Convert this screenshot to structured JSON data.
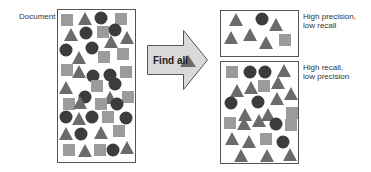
{
  "labels": {
    "document": "Document",
    "arrow": "Find all",
    "precision_box": [
      "High precision,",
      "low recall"
    ],
    "recall_box": [
      "High recall,",
      "low precision"
    ]
  },
  "colors": {
    "square": "#9b9b9b",
    "triangle": "#6b6b6b",
    "circle": "#3c3c3c",
    "arrow_fill": "#d9d9d9",
    "outline": "#555555"
  },
  "boxes": {
    "document": {
      "x": 57,
      "y": 9,
      "w": 78,
      "h": 153
    },
    "precision": {
      "x": 220,
      "y": 10,
      "w": 78,
      "h": 46
    },
    "recall": {
      "x": 220,
      "y": 61,
      "w": 78,
      "h": 102
    }
  },
  "shapes": {
    "document": [
      [
        "s",
        67,
        20
      ],
      [
        "t",
        85,
        19
      ],
      [
        "c",
        101,
        18
      ],
      [
        "s",
        121,
        19
      ],
      [
        "t",
        71,
        35
      ],
      [
        "c",
        86,
        33
      ],
      [
        "s",
        103,
        32
      ],
      [
        "c",
        115,
        30
      ],
      [
        "t",
        111,
        42
      ],
      [
        "t",
        127,
        38
      ],
      [
        "c",
        66,
        50
      ],
      [
        "c",
        92,
        48
      ],
      [
        "t",
        79,
        58
      ],
      [
        "s",
        104,
        57
      ],
      [
        "s",
        123,
        54
      ],
      [
        "s",
        67,
        70
      ],
      [
        "t",
        79,
        72
      ],
      [
        "c",
        93,
        76
      ],
      [
        "c",
        110,
        75
      ],
      [
        "s",
        126,
        72
      ],
      [
        "t",
        66,
        88
      ],
      [
        "s",
        97,
        86
      ],
      [
        "c",
        115,
        84
      ],
      [
        "c",
        85,
        97
      ],
      [
        "t",
        110,
        98
      ],
      [
        "s",
        128,
        97
      ],
      [
        "s",
        69,
        104
      ],
      [
        "t",
        80,
        103
      ],
      [
        "s",
        101,
        104
      ],
      [
        "c",
        117,
        104
      ],
      [
        "c",
        66,
        117
      ],
      [
        "t",
        79,
        119
      ],
      [
        "c",
        92,
        117
      ],
      [
        "s",
        108,
        117
      ],
      [
        "c",
        126,
        118
      ],
      [
        "t",
        66,
        134
      ],
      [
        "c",
        81,
        134
      ],
      [
        "t",
        101,
        133
      ],
      [
        "s",
        119,
        131
      ],
      [
        "s",
        69,
        150
      ],
      [
        "t",
        85,
        151
      ],
      [
        "s",
        100,
        150
      ],
      [
        "c",
        113,
        150
      ],
      [
        "t",
        127,
        148
      ]
    ],
    "precision": [
      [
        "t",
        236,
        20
      ],
      [
        "c",
        262,
        19
      ],
      [
        "t",
        276,
        25
      ],
      [
        "t",
        231,
        38
      ],
      [
        "t",
        250,
        35
      ],
      [
        "t",
        266,
        43
      ],
      [
        "s",
        285,
        40
      ]
    ],
    "recall": [
      [
        "s",
        232,
        72
      ],
      [
        "c",
        250,
        72
      ],
      [
        "c",
        265,
        72
      ],
      [
        "t",
        284,
        71
      ],
      [
        "t",
        237,
        91
      ],
      [
        "t",
        251,
        88
      ],
      [
        "s",
        264,
        86
      ],
      [
        "t",
        278,
        83
      ],
      [
        "t",
        277,
        99
      ],
      [
        "t",
        291,
        94
      ],
      [
        "c",
        231,
        103
      ],
      [
        "c",
        258,
        102
      ],
      [
        "t",
        245,
        115
      ],
      [
        "t",
        268,
        115
      ],
      [
        "s",
        292,
        113
      ],
      [
        "s",
        230,
        123
      ],
      [
        "t",
        244,
        124
      ],
      [
        "t",
        259,
        121
      ],
      [
        "c",
        276,
        124
      ],
      [
        "s",
        291,
        125
      ],
      [
        "t",
        232,
        139
      ],
      [
        "t",
        249,
        142
      ],
      [
        "s",
        266,
        139
      ],
      [
        "c",
        283,
        142
      ],
      [
        "t",
        241,
        156
      ],
      [
        "t",
        267,
        156
      ],
      [
        "t",
        290,
        155
      ]
    ]
  }
}
